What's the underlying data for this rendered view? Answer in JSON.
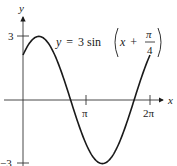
{
  "chart_data": {
    "type": "line",
    "title": "",
    "equation": {
      "lhs": "y",
      "equals": "=",
      "coef": "3",
      "func": "sin",
      "var": "x",
      "plus": "+",
      "frac_num": "π",
      "frac_den": "4"
    },
    "xlabel": "x",
    "ylabel": "y",
    "x_ticks": [
      {
        "value": 3.14159,
        "label": "π"
      },
      {
        "value": 6.28318,
        "label": "2π"
      }
    ],
    "y_ticks": [
      {
        "value": 3,
        "label": "3"
      },
      {
        "value": -3,
        "label": "−3"
      }
    ],
    "xlim": [
      -1.14,
      7.3
    ],
    "ylim": [
      -3.1,
      4.7
    ],
    "grid": false,
    "series": [
      {
        "name": "y = 3sin(x + π/4)",
        "function": "3*sin(x+pi/4)",
        "x_range": [
          0,
          6.28318
        ],
        "x": [
          0,
          0.785,
          1.571,
          2.356,
          3.142,
          3.927,
          4.712,
          5.498,
          6.283
        ],
        "y": [
          2.12,
          3.0,
          2.12,
          0.0,
          -2.12,
          -3.0,
          -2.12,
          0.0,
          2.12
        ],
        "color": "#1a1a1a"
      }
    ]
  }
}
